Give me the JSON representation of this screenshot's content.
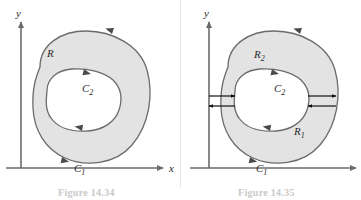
{
  "figure": {
    "domain": "Diagram",
    "background_color": "#ffffff",
    "region_fill_color": "#e3e3e3",
    "curve_stroke_color": "#6b6b6b",
    "axis_stroke_color": "#6b6b6b",
    "label_color": "#2b2b2b",
    "panels": [
      {
        "id": "left",
        "axes": {
          "y_label": "y",
          "x_label": "x"
        },
        "labels": [
          {
            "name": "region-label-R",
            "text": "R",
            "sub": "",
            "x": 47,
            "y": 57
          },
          {
            "name": "curve-label-C2",
            "text": "C",
            "sub": "2",
            "x": 82,
            "y": 92
          },
          {
            "name": "curve-label-C1",
            "text": "C",
            "sub": "1",
            "x": 74,
            "y": 172
          }
        ],
        "caption": "Figure 14.34"
      },
      {
        "id": "right",
        "axes": {
          "y_label": "y",
          "x_label": ""
        },
        "labels": [
          {
            "name": "region-label-R2",
            "text": "R",
            "sub": "2",
            "x": 74,
            "y": 58
          },
          {
            "name": "curve-label-C2",
            "text": "C",
            "sub": "2",
            "x": 94,
            "y": 92
          },
          {
            "name": "region-label-R1",
            "text": "R",
            "sub": "1",
            "x": 114,
            "y": 135
          },
          {
            "name": "curve-label-C1",
            "text": "C",
            "sub": "1",
            "x": 76,
            "y": 172
          }
        ],
        "cut_arrows": [
          {
            "name": "cut-arrow-left-top",
            "direction": "right"
          },
          {
            "name": "cut-arrow-left-bottom",
            "direction": "left"
          },
          {
            "name": "cut-arrow-right-top",
            "direction": "right"
          },
          {
            "name": "cut-arrow-right-bottom",
            "direction": "left"
          }
        ],
        "caption": "Figure 14.35"
      }
    ]
  }
}
